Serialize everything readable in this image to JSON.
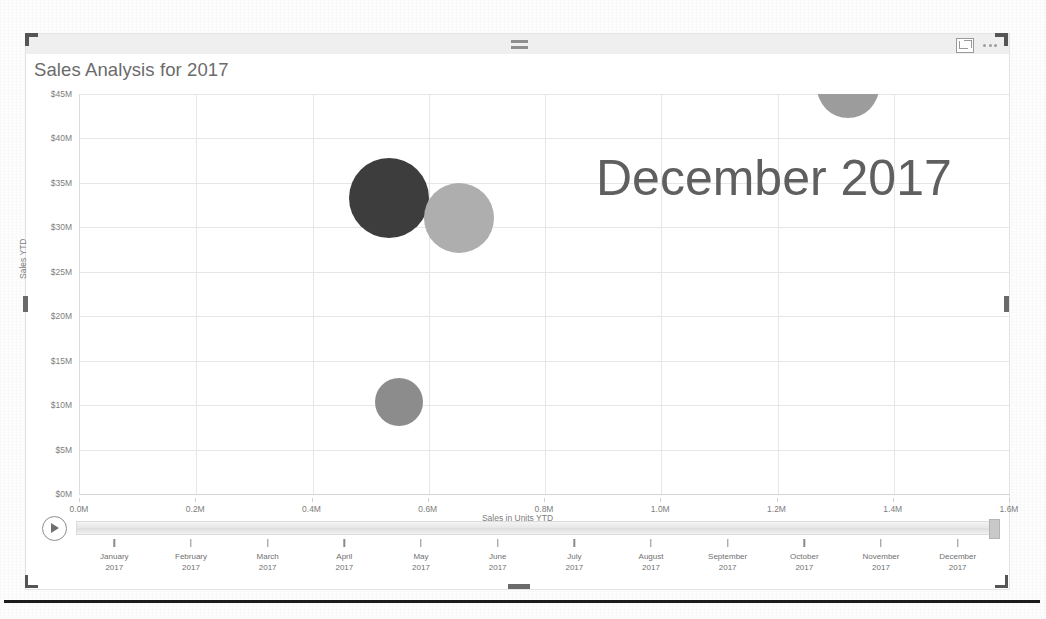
{
  "visual": {
    "title": "Sales Analysis for 2017",
    "watermark": "December 2017",
    "icons": {
      "focus": "focus-mode-icon",
      "more": "more-options-icon"
    }
  },
  "chart_data": {
    "type": "scatter",
    "title": "Sales Analysis for 2017",
    "xlabel": "Sales in Units YTD",
    "ylabel": "Sales YTD",
    "xlim": [
      0.0,
      1.6
    ],
    "ylim": [
      0,
      45
    ],
    "xticks": [
      "0.0M",
      "0.2M",
      "0.4M",
      "0.6M",
      "0.8M",
      "1.0M",
      "1.2M",
      "1.4M",
      "1.6M"
    ],
    "xtick_values": [
      0.0,
      0.2,
      0.4,
      0.6,
      0.8,
      1.0,
      1.2,
      1.4,
      1.6
    ],
    "yticks": [
      "$0M",
      "$5M",
      "$10M",
      "$15M",
      "$20M",
      "$25M",
      "$30M",
      "$35M",
      "$40M",
      "$45M"
    ],
    "ytick_values": [
      0,
      5,
      10,
      15,
      20,
      25,
      30,
      35,
      40,
      45
    ],
    "grid": true,
    "legend": "none",
    "annotation": "December 2017",
    "points": [
      {
        "name": "bubble-dark",
        "x": 0.532,
        "y": 33.3,
        "size": 80,
        "color": "#3d3d3d"
      },
      {
        "name": "bubble-light",
        "x": 0.652,
        "y": 31.1,
        "size": 70,
        "color": "#aeaeae"
      },
      {
        "name": "bubble-medium",
        "x": 0.549,
        "y": 10.4,
        "size": 48,
        "color": "#8c8c8c"
      },
      {
        "name": "bubble-clipped-top",
        "x": 1.322,
        "y": 45.8,
        "size": 62,
        "color": "#9c9c9c"
      }
    ]
  },
  "timeline": {
    "play_label": "play-button",
    "selected": "December 2017",
    "months": [
      {
        "month": "January",
        "year": "2017"
      },
      {
        "month": "February",
        "year": "2017"
      },
      {
        "month": "March",
        "year": "2017"
      },
      {
        "month": "April",
        "year": "2017"
      },
      {
        "month": "May",
        "year": "2017"
      },
      {
        "month": "June",
        "year": "2017"
      },
      {
        "month": "July",
        "year": "2017"
      },
      {
        "month": "August",
        "year": "2017"
      },
      {
        "month": "September",
        "year": "2017"
      },
      {
        "month": "October",
        "year": "2017"
      },
      {
        "month": "November",
        "year": "2017"
      },
      {
        "month": "December",
        "year": "2017"
      }
    ]
  }
}
